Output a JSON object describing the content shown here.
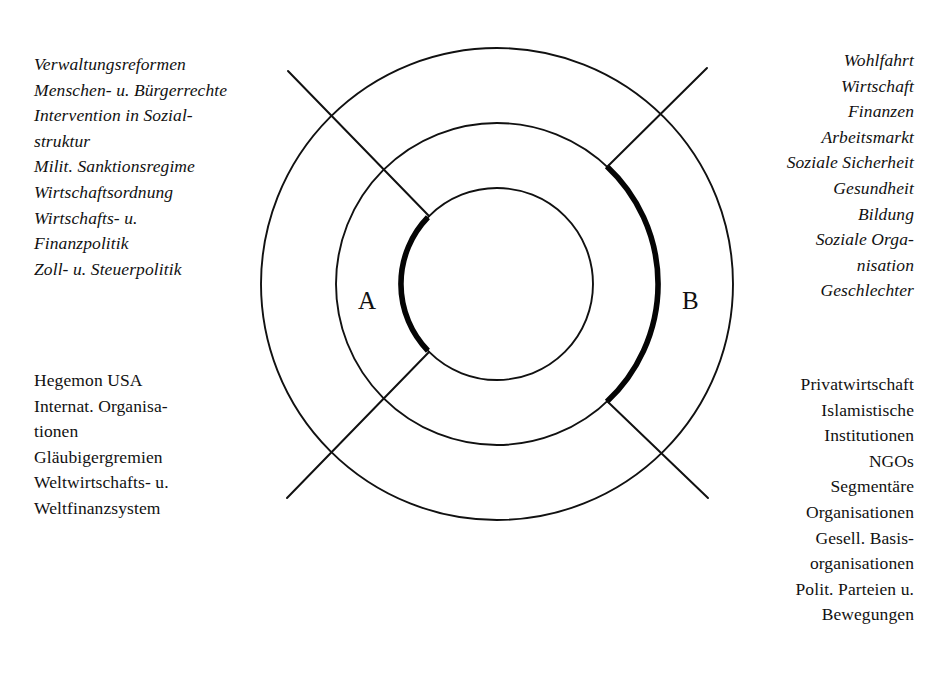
{
  "figure": {
    "name": "concentric-zone-diagram",
    "zones": [
      {
        "id": "A",
        "label": "A"
      },
      {
        "id": "B",
        "label": "B"
      }
    ],
    "rings": {
      "outer": {
        "name": "outer-ring"
      },
      "middle": {
        "name": "middle-ring",
        "highlight_side": "right"
      },
      "inner": {
        "name": "inner-ring",
        "highlight_side": "left"
      }
    },
    "accent_color": "#050505",
    "line_color": "#111111",
    "background": "#ffffff"
  },
  "blocks": {
    "top_left": {
      "style": "italic",
      "align": "left",
      "lines": [
        "Verwaltungsreformen",
        "Menschen- u. Bürgerrechte",
        "Intervention in Sozial-",
        "struktur",
        "Milit. Sanktionsregime",
        "Wirtschaftsordnung",
        "Wirtschafts- u.",
        "Finanzpolitik",
        "Zoll- u. Steuerpolitik"
      ]
    },
    "bottom_left": {
      "style": "upright",
      "align": "left",
      "lines": [
        "Hegemon USA",
        "Internat. Organisa-",
        "tionen",
        "Gläubigergremien",
        "Weltwirtschafts- u.",
        "Weltfinanzsystem"
      ]
    },
    "top_right": {
      "style": "italic",
      "align": "right",
      "lines": [
        "Wohlfahrt",
        "Wirtschaft",
        "Finanzen",
        "Arbeitsmarkt",
        "Soziale Sicherheit",
        "Gesundheit",
        "Bildung",
        "Soziale Orga-",
        "nisation",
        "Geschlechter"
      ]
    },
    "bottom_right": {
      "style": "upright",
      "align": "right",
      "lines": [
        "Privatwirtschaft",
        "Islamistische",
        "Institutionen",
        "NGOs",
        "Segmentäre",
        "Organisationen",
        "Gesell. Basis-",
        "organisationen",
        "Polit. Parteien u.",
        "Bewegungen"
      ]
    }
  }
}
